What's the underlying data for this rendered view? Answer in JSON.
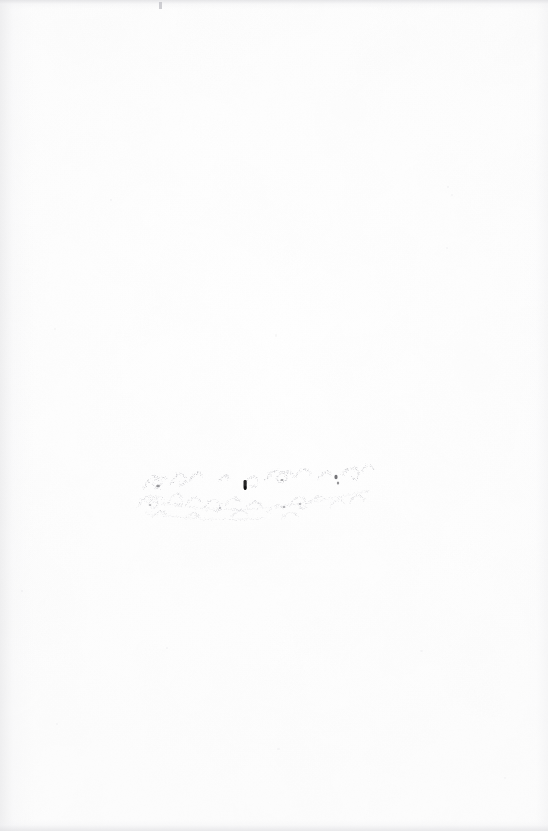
{
  "document": {
    "type": "scanned-page",
    "page_kind": "blank-flyleaf",
    "width_px": 548,
    "height_px": 831,
    "background_color": "#ffffff",
    "visible_text": "",
    "description": "Near-blank scanned book page (endpaper/flyleaf) with a faint, heavily faded handwritten inscription across the middle"
  },
  "inscription": {
    "label": "faded-handwritten-inscription",
    "legible_text": "",
    "transcription_note": "illegible",
    "ink_color": "#b9b9bf",
    "darkest_mark_color": "#1a1a1a",
    "position": {
      "x": 132,
      "y": 455,
      "width": 250,
      "height": 72
    },
    "line_count": 2
  },
  "scan_artifacts": {
    "gutter_shadow_side": "left",
    "edge_shadow_color": "#dddde0",
    "paper_tone": "#fdfdfd",
    "speck_color": "#d6d6da"
  }
}
